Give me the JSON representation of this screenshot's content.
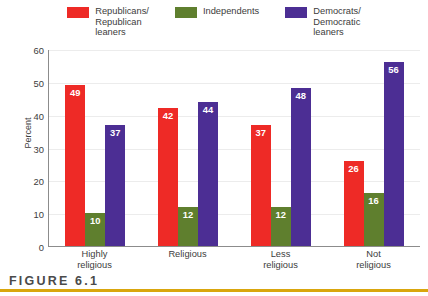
{
  "chart_data": {
    "type": "bar",
    "title": "",
    "subtitle": "",
    "xlabel": "",
    "ylabel": "Percent",
    "ylim": [
      0,
      60
    ],
    "yticks": [
      0,
      10,
      20,
      30,
      40,
      50,
      60
    ],
    "grid": true,
    "legend_position": "top",
    "categories": [
      "Highly\nreligious",
      "Religious",
      "Less\nreligious",
      "Not\nreligious"
    ],
    "series": [
      {
        "name": "Republicans/\nRepublican\nleaners",
        "color": "#ee2a26",
        "values": [
          49,
          42,
          37,
          26
        ]
      },
      {
        "name": "Independents",
        "color": "#5f7f2e",
        "values": [
          10,
          12,
          12,
          16
        ]
      },
      {
        "name": "Democrats/\nDemocratic\nleaners",
        "color": "#4c2e94",
        "values": [
          37,
          44,
          48,
          56
        ]
      }
    ]
  },
  "caption": {
    "figure_label": "FIGURE 6.1",
    "rule_color": "#d9a60d"
  }
}
